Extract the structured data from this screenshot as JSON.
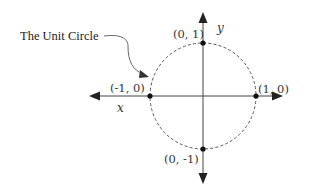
{
  "diagram": {
    "title": "The Unit Circle",
    "axes": {
      "x_label": "x",
      "y_label": "y"
    },
    "points": [
      {
        "id": "top",
        "label": "(0, 1)",
        "x": 0,
        "y": 1
      },
      {
        "id": "right",
        "label": "(1, 0)",
        "x": 1,
        "y": 0
      },
      {
        "id": "left",
        "label": "(-1, 0)",
        "x": -1,
        "y": 0
      },
      {
        "id": "bottom",
        "label": "(0, -1)",
        "x": 0,
        "y": -1
      }
    ],
    "circle": {
      "radius": 1,
      "style": "dashed"
    },
    "colors": {
      "ink": "#333333",
      "circle": "#555555"
    }
  }
}
